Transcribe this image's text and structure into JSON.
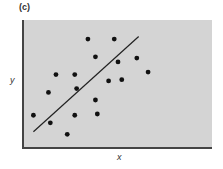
{
  "chart_data": {
    "type": "scatter",
    "panel_label": "(c)",
    "title": "",
    "xlabel": "x",
    "ylabel": "y",
    "xlim": [
      0,
      100
    ],
    "ylim": [
      0,
      100
    ],
    "grid": false,
    "legend": null,
    "background": "#d4d4d4",
    "points": [
      {
        "x": 34,
        "y": 85
      },
      {
        "x": 48,
        "y": 85
      },
      {
        "x": 38,
        "y": 71
      },
      {
        "x": 50,
        "y": 67
      },
      {
        "x": 60,
        "y": 70
      },
      {
        "x": 66,
        "y": 59
      },
      {
        "x": 17,
        "y": 57
      },
      {
        "x": 27,
        "y": 57
      },
      {
        "x": 45,
        "y": 52
      },
      {
        "x": 52,
        "y": 53
      },
      {
        "x": 13,
        "y": 43
      },
      {
        "x": 28,
        "y": 46
      },
      {
        "x": 38,
        "y": 37
      },
      {
        "x": 5,
        "y": 25
      },
      {
        "x": 27,
        "y": 25
      },
      {
        "x": 39,
        "y": 26
      },
      {
        "x": 14,
        "y": 19
      },
      {
        "x": 23,
        "y": 10
      }
    ],
    "regression_line": {
      "x1": 5,
      "y1": 12,
      "x2": 61,
      "y2": 87
    },
    "point_color": "#111111",
    "line_color": "#222222"
  }
}
